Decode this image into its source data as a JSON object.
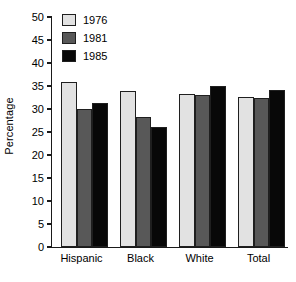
{
  "chart_data": {
    "type": "bar",
    "title": "",
    "subtitle": "",
    "xlabel": "",
    "ylabel": "Percentage",
    "categories": [
      "Hispanic",
      "Black",
      "White",
      "Total"
    ],
    "series": [
      {
        "name": "1976",
        "color": "#e2e2e2",
        "values": [
          35.8,
          33.9,
          33.3,
          32.7
        ]
      },
      {
        "name": "1981",
        "color": "#585858",
        "values": [
          30.0,
          28.3,
          33.0,
          32.3
        ]
      },
      {
        "name": "1985",
        "color": "#080808",
        "values": [
          31.3,
          26.1,
          34.9,
          34.1
        ]
      }
    ],
    "ylim": [
      0,
      50
    ],
    "ytick_step": 5,
    "yticks": [
      "0",
      "5",
      "10",
      "15",
      "20",
      "25",
      "30",
      "35",
      "40",
      "45",
      "50"
    ],
    "grid": false,
    "legend_position": "top-left",
    "axis_color": "#1a1a1a",
    "bar_border_color": "#1f1f1f",
    "background": "#ffffff"
  }
}
